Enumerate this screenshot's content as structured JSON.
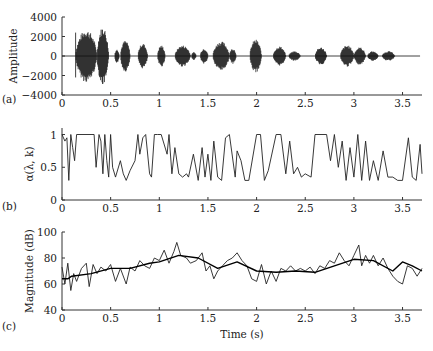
{
  "figure": {
    "panels": [
      "(a)",
      "(b)",
      "(c)"
    ]
  },
  "chart_data": [
    {
      "type": "area",
      "panel_label": "(a)",
      "title": "",
      "xlabel": "",
      "ylabel": "Amplitude",
      "xlim": [
        0,
        3.7
      ],
      "ylim": [
        -4000,
        4000
      ],
      "xticks": [
        0,
        0.5,
        1,
        1.5,
        2,
        2.5,
        3,
        3.5
      ],
      "xtick_labels": [
        "0",
        "0.5",
        "1",
        "1.5",
        "2",
        "2.5",
        "3",
        "3.5"
      ],
      "yticks": [
        4000,
        2000,
        0,
        -2000,
        -4000
      ],
      "ytick_labels": [
        "4000",
        "2000",
        "0",
        "−2000",
        "−4000"
      ],
      "description": "Speech waveform envelope (bursts of syllables)",
      "segments": [
        {
          "start": 0.14,
          "end": 0.36,
          "peak": 2700
        },
        {
          "start": 0.36,
          "end": 0.48,
          "peak": 3000
        },
        {
          "start": 0.54,
          "end": 0.59,
          "peak": 700
        },
        {
          "start": 0.6,
          "end": 0.7,
          "peak": 1600
        },
        {
          "start": 0.78,
          "end": 0.88,
          "peak": 1300
        },
        {
          "start": 0.98,
          "end": 1.06,
          "peak": 1100
        },
        {
          "start": 1.16,
          "end": 1.32,
          "peak": 1100
        },
        {
          "start": 1.33,
          "end": 1.38,
          "peak": 400
        },
        {
          "start": 1.42,
          "end": 1.5,
          "peak": 800
        },
        {
          "start": 1.55,
          "end": 1.72,
          "peak": 1500
        },
        {
          "start": 1.72,
          "end": 1.79,
          "peak": 800
        },
        {
          "start": 1.93,
          "end": 2.05,
          "peak": 1700
        },
        {
          "start": 2.17,
          "end": 2.3,
          "peak": 1000
        },
        {
          "start": 2.33,
          "end": 2.45,
          "peak": 500
        },
        {
          "start": 2.6,
          "end": 2.72,
          "peak": 900
        },
        {
          "start": 2.86,
          "end": 3.0,
          "peak": 1100
        },
        {
          "start": 3.0,
          "end": 3.12,
          "peak": 900
        },
        {
          "start": 3.14,
          "end": 3.25,
          "peak": 500
        },
        {
          "start": 3.29,
          "end": 3.42,
          "peak": 500
        }
      ]
    },
    {
      "type": "line",
      "panel_label": "(b)",
      "xlabel": "",
      "ylabel": "α(λ, k)",
      "xlim": [
        0,
        3.7
      ],
      "ylim": [
        0,
        1.1
      ],
      "xticks": [
        0,
        0.5,
        1,
        1.5,
        2,
        2.5,
        3,
        3.5
      ],
      "xtick_labels": [
        "0",
        "0.5",
        "1",
        "1.5",
        "2",
        "2.5",
        "3",
        "3.5"
      ],
      "yticks": [
        1,
        0.5,
        0
      ],
      "ytick_labels": [
        "1",
        "0.5",
        "0"
      ],
      "series": [
        {
          "name": "alpha",
          "x": [
            0,
            0.03,
            0.05,
            0.07,
            0.09,
            0.11,
            0.13,
            0.15,
            0.33,
            0.35,
            0.38,
            0.4,
            0.42,
            0.44,
            0.46,
            0.48,
            0.5,
            0.52,
            0.55,
            0.6,
            0.63,
            0.66,
            0.7,
            0.75,
            0.78,
            0.8,
            0.83,
            0.86,
            0.9,
            0.92,
            0.95,
            0.98,
            1.02,
            1.08,
            1.1,
            1.13,
            1.16,
            1.2,
            1.24,
            1.28,
            1.3,
            1.35,
            1.4,
            1.44,
            1.47,
            1.5,
            1.53,
            1.56,
            1.6,
            1.64,
            1.68,
            1.72,
            1.78,
            1.8,
            1.84,
            1.88,
            1.92,
            2.0,
            2.04,
            2.08,
            2.12,
            2.2,
            2.25,
            2.3,
            2.34,
            2.38,
            2.42,
            2.46,
            2.5,
            2.56,
            2.6,
            2.72,
            2.76,
            2.8,
            2.84,
            2.88,
            2.92,
            2.96,
            3.0,
            3.04,
            3.08,
            3.12,
            3.16,
            3.2,
            3.25,
            3.3,
            3.35,
            3.4,
            3.45,
            3.5,
            3.56,
            3.6,
            3.64,
            3.68,
            3.7
          ],
          "values": [
            1,
            0.9,
            0.95,
            0.3,
            1,
            0.8,
            0.6,
            1,
            1,
            0.5,
            1,
            0.9,
            0.4,
            1,
            0.6,
            0.35,
            1,
            0.5,
            0.35,
            0.6,
            0.4,
            0.3,
            0.45,
            0.6,
            1,
            0.7,
            0.95,
            1,
            0.4,
            0.35,
            1,
            1,
            1,
            0.7,
            1,
            0.4,
            0.8,
            0.4,
            0.35,
            0.4,
            0.35,
            0.7,
            0.3,
            0.8,
            0.35,
            0.7,
            0.3,
            0.9,
            0.35,
            0.3,
            0.95,
            1,
            0.35,
            0.75,
            0.6,
            0.3,
            0.3,
            1,
            1,
            0.3,
            0.45,
            1,
            1,
            0.4,
            0.9,
            0.4,
            0.5,
            0.35,
            0.4,
            0.35,
            1,
            1,
            0.6,
            1,
            0.5,
            0.9,
            0.3,
            0.8,
            0.35,
            1,
            0.3,
            0.9,
            0.3,
            0.6,
            0.3,
            0.75,
            0.35,
            0.35,
            0.3,
            0.3,
            0.95,
            0.35,
            0.3,
            0.85,
            0.4
          ]
        }
      ]
    },
    {
      "type": "line",
      "panel_label": "(c)",
      "xlabel": "Time (s)",
      "ylabel": "Magnitude (dB)",
      "xlim": [
        0,
        3.7
      ],
      "ylim": [
        40,
        100
      ],
      "xticks": [
        0,
        0.5,
        1,
        1.5,
        2,
        2.5,
        3,
        3.5
      ],
      "xtick_labels": [
        "0",
        "0.5",
        "1",
        "1.5",
        "2",
        "2.5",
        "3",
        "3.5"
      ],
      "yticks": [
        100,
        80,
        60,
        40
      ],
      "ytick_labels": [
        "100",
        "80",
        "60",
        "40"
      ],
      "series": [
        {
          "name": "noisy magnitude",
          "x": [
            0,
            0.03,
            0.06,
            0.09,
            0.12,
            0.15,
            0.2,
            0.25,
            0.28,
            0.32,
            0.36,
            0.4,
            0.45,
            0.5,
            0.55,
            0.6,
            0.66,
            0.7,
            0.75,
            0.8,
            0.85,
            0.9,
            0.95,
            1.0,
            1.05,
            1.1,
            1.15,
            1.18,
            1.22,
            1.28,
            1.32,
            1.38,
            1.44,
            1.48,
            1.52,
            1.56,
            1.6,
            1.65,
            1.7,
            1.75,
            1.8,
            1.85,
            1.9,
            1.95,
            2.0,
            2.05,
            2.1,
            2.15,
            2.2,
            2.25,
            2.3,
            2.35,
            2.4,
            2.45,
            2.5,
            2.55,
            2.6,
            2.65,
            2.7,
            2.75,
            2.8,
            2.85,
            2.9,
            2.95,
            3.0,
            3.05,
            3.08,
            3.12,
            3.16,
            3.2,
            3.25,
            3.3,
            3.35,
            3.4,
            3.45,
            3.5,
            3.55,
            3.6,
            3.65,
            3.7
          ],
          "values": [
            73,
            60,
            76,
            55,
            68,
            62,
            72,
            76,
            58,
            75,
            68,
            73,
            70,
            75,
            62,
            72,
            60,
            73,
            70,
            78,
            74,
            72,
            80,
            78,
            86,
            76,
            85,
            92,
            82,
            80,
            76,
            78,
            84,
            70,
            74,
            64,
            70,
            74,
            78,
            80,
            84,
            78,
            74,
            64,
            62,
            75,
            60,
            70,
            62,
            72,
            70,
            74,
            70,
            72,
            70,
            73,
            68,
            74,
            72,
            78,
            76,
            84,
            78,
            74,
            82,
            90,
            74,
            82,
            76,
            82,
            74,
            80,
            72,
            66,
            62,
            60,
            74,
            72,
            66,
            72
          ]
        },
        {
          "name": "smoothed estimate",
          "x": [
            0,
            0.06,
            0.1,
            0.3,
            0.5,
            0.7,
            0.9,
            1.0,
            1.2,
            1.4,
            1.6,
            1.8,
            2.0,
            2.2,
            2.4,
            2.6,
            2.8,
            3.0,
            3.2,
            3.4,
            3.5,
            3.6,
            3.7
          ],
          "values": [
            64,
            64,
            66,
            68,
            72,
            72,
            76,
            77,
            82,
            80,
            72,
            77,
            70,
            69,
            70,
            69,
            74,
            79,
            78,
            70,
            77,
            74,
            70
          ]
        }
      ]
    }
  ]
}
